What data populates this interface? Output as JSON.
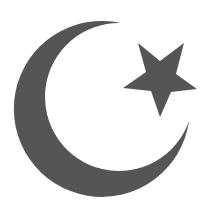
{
  "image": {
    "description": "Crescent moon and five-pointed star symbol",
    "background_color": "#ffffff",
    "fill_color": "#555555"
  },
  "symbol": {
    "name": "star-and-crescent",
    "label": "Star and crescent",
    "crescent": {
      "label": "Crescent",
      "outer_circle": {
        "cx": 103,
        "cy": 112,
        "r": 88
      },
      "inner_circle": {
        "cx": 120,
        "cy": 98,
        "r": 74
      },
      "tips": [
        [
          121,
          23
        ],
        [
          189,
          121
        ]
      ]
    },
    "star": {
      "label": "Five-pointed star",
      "points": [
        [
          138,
          43
        ],
        [
          160,
          61
        ],
        [
          184,
          43
        ],
        [
          176,
          74
        ],
        [
          197,
          89
        ],
        [
          171,
          92
        ],
        [
          160,
          117
        ],
        [
          151,
          91
        ],
        [
          123,
          88
        ],
        [
          146,
          72
        ]
      ]
    }
  }
}
